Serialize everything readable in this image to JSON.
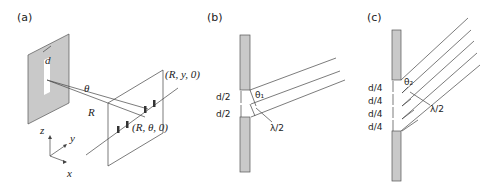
{
  "panels": [
    {
      "id": "a",
      "label": "(a)",
      "slit_width_label": "d",
      "angle_label": "θ",
      "distance_label": "R",
      "point_top_label": "(R, y, 0)",
      "point_bottom_label": "(R, θ, 0)",
      "axes": {
        "z": "z",
        "y": "y",
        "x": "x"
      }
    },
    {
      "id": "b",
      "label": "(b)",
      "segment_labels": [
        "d/2",
        "d/2"
      ],
      "angle_label": "θ₁",
      "path_diff_label": "λ/2",
      "ray_count": 3
    },
    {
      "id": "c",
      "label": "(c)",
      "segment_labels": [
        "d/4",
        "d/4",
        "d/4",
        "d/4"
      ],
      "angle_label": "θ₂",
      "path_diff_label": "λ/2",
      "ray_count": 5
    }
  ],
  "colors": {
    "plate": "#c9c9c9",
    "line": "#444444",
    "text": "#222222"
  }
}
